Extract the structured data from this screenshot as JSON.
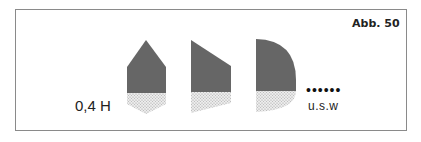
{
  "figure": {
    "label": "Abb. 50",
    "height_label": "0,4 H",
    "continuation_dots": "••••••",
    "continuation_label": "u.s.w"
  },
  "shapes": [
    {
      "name": "pointed-shape",
      "description": "pentagon with pointed top and pointed bottom"
    },
    {
      "name": "slanted-shape",
      "description": "trapezoid with slanted top and slanted bottom"
    },
    {
      "name": "rounded-shape",
      "description": "quarter-round top and rounded bottom"
    }
  ],
  "colors": {
    "upper_fill": "#666666",
    "lower_fill": "#e6e6e6",
    "lower_dot": "#9a9a9a",
    "frame": "#8a8a8a"
  }
}
